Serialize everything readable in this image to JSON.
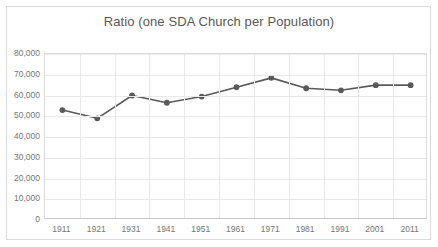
{
  "chart_data": {
    "type": "line",
    "title": "Ratio (one SDA Church per Population)",
    "xlabel": "",
    "ylabel": "",
    "categories": [
      "1911",
      "1921",
      "1931",
      "1941",
      "1951",
      "1961",
      "1971",
      "1981",
      "1991",
      "2001",
      "2011"
    ],
    "values": [
      53000,
      49000,
      60000,
      56500,
      59500,
      64000,
      68500,
      63500,
      62500,
      65000,
      65000
    ],
    "ylim": [
      0,
      80000
    ],
    "y_ticks": [
      "0",
      "10,000",
      "20,000",
      "30,000",
      "40,000",
      "50,000",
      "60,000",
      "70,000",
      "80,000"
    ],
    "y_tick_values": [
      0,
      10000,
      20000,
      30000,
      40000,
      50000,
      60000,
      70000,
      80000
    ],
    "grid": "horizontal-and-vertical",
    "legend": "none",
    "series": [
      {
        "name": "Ratio (one SDA Church per Population)",
        "color": "#595959",
        "marker": "circle",
        "values": [
          53000,
          49000,
          60000,
          56500,
          59500,
          64000,
          68500,
          63500,
          62500,
          65000,
          65000
        ]
      }
    ]
  },
  "colors": {
    "series_line": "#595959",
    "grid": "#e8e8e8",
    "frame": "#d9d9d9",
    "text": "#767676",
    "title_text": "#585858",
    "background": "#ffffff"
  }
}
